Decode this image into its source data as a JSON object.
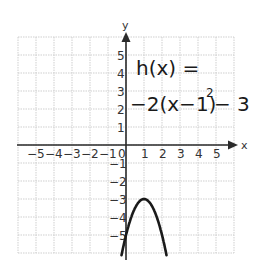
{
  "chart_data": {
    "type": "line",
    "title": "",
    "annotation": {
      "line1": "h(x) =",
      "line2": "−2(x−1)",
      "exponent": "2",
      "line2_tail": "− 3"
    },
    "function": "h(x) = -2(x-1)^2 - 3",
    "xlabel": "x",
    "ylabel": "y",
    "xlim": [
      -6,
      6
    ],
    "ylim": [
      -6,
      6
    ],
    "grid": true,
    "x_tick_labels": [
      "−5",
      "−4",
      "−3",
      "−2",
      "−1",
      "0",
      "1",
      "2",
      "3",
      "4",
      "5"
    ],
    "y_tick_labels_positive": [
      "5",
      "4",
      "3",
      "2",
      "1"
    ],
    "y_tick_labels_negative": [
      "−1",
      "−2",
      "−3",
      "−4",
      "−5"
    ],
    "series": [
      {
        "name": "h(x)",
        "x": [
          -0.25,
          0,
          0.25,
          0.5,
          0.75,
          1,
          1.25,
          1.5,
          1.75,
          2,
          2.25
        ],
        "y": [
          -6.125,
          -5,
          -4.125,
          -3.5,
          -3.125,
          -3,
          -3.125,
          -3.5,
          -4.125,
          -5,
          -6.125
        ]
      }
    ],
    "vertex": [
      1,
      -3
    ],
    "colors": {
      "grid": "#c8c8c8",
      "axis": "#2a2a2a",
      "curve": "#1a1a1a"
    }
  }
}
